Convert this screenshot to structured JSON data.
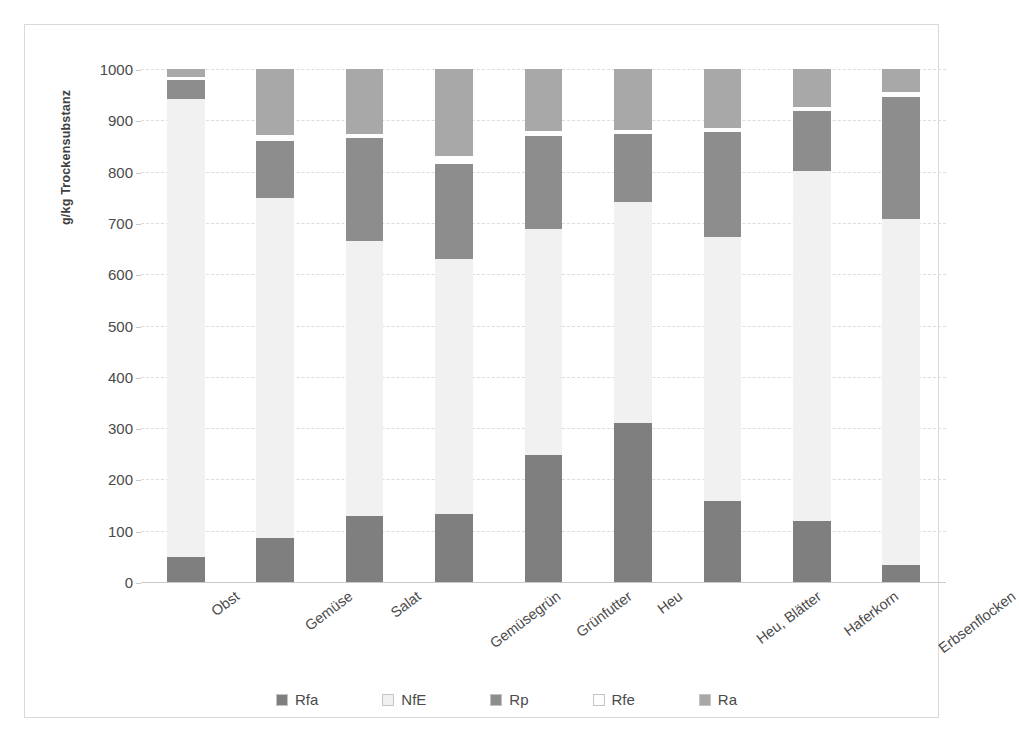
{
  "chart_data": {
    "type": "bar",
    "subtype": "stacked-bar",
    "title": "",
    "xlabel": "",
    "ylabel": "g/kg Trockensubstanz",
    "ylim": [
      0,
      1000
    ],
    "yticks": [
      0,
      100,
      200,
      300,
      400,
      500,
      600,
      700,
      800,
      900,
      1000
    ],
    "ytick_labels": [
      "0",
      "100",
      "200",
      "300",
      "400",
      "500",
      "600",
      "700",
      "800",
      "900",
      "1000"
    ],
    "grid": true,
    "legend_position": "bottom",
    "stack_order_bottom_to_top": [
      "Rfa",
      "NfE",
      "Rp",
      "Rfe",
      "Ra"
    ],
    "categories": [
      "Obst",
      "Gemüse",
      "Salat",
      "Gemüsegrün",
      "Grünfutter",
      "Heu",
      "Heu, Blätter",
      "Haferkorn",
      "Erbsenflocken"
    ],
    "series": [
      {
        "name": "Rfa",
        "color": "#7f7f7f",
        "values": [
          48,
          85,
          128,
          132,
          248,
          310,
          157,
          118,
          33
        ]
      },
      {
        "name": "NfE",
        "color": "#f1f1f1",
        "values": [
          893,
          663,
          537,
          498,
          440,
          430,
          515,
          683,
          675
        ]
      },
      {
        "name": "Rfe",
        "color": "#fdfdfd",
        "values": [
          7,
          12,
          9,
          16,
          11,
          8,
          8,
          8,
          9
        ],
        "note": "thin white band above NfE"
      },
      {
        "name": "Rp",
        "color": "#8d8d8d",
        "values": [
          37,
          112,
          200,
          185,
          181,
          133,
          205,
          117,
          238
        ]
      },
      {
        "name": "Ra",
        "color": "#a8a8a8",
        "values": [
          15,
          128,
          126,
          169,
          120,
          119,
          115,
          74,
          45
        ]
      }
    ],
    "bars": [
      {
        "category": "Obst",
        "segments": [
          {
            "name": "Rfa",
            "value": 48,
            "from": 0,
            "to": 48
          },
          {
            "name": "NfE",
            "value": 893,
            "from": 48,
            "to": 941
          },
          {
            "name": "Rp",
            "value": 37,
            "from": 941,
            "to": 978
          },
          {
            "name": "Rfe",
            "value": 7,
            "from": 978,
            "to": 985
          },
          {
            "name": "Ra",
            "value": 15,
            "from": 985,
            "to": 1000
          }
        ],
        "total": 1000
      },
      {
        "category": "Gemüse",
        "segments": [
          {
            "name": "Rfa",
            "value": 85,
            "from": 0,
            "to": 85
          },
          {
            "name": "NfE",
            "value": 663,
            "from": 85,
            "to": 748
          },
          {
            "name": "Rp",
            "value": 112,
            "from": 748,
            "to": 860
          },
          {
            "name": "Rfe",
            "value": 12,
            "from": 860,
            "to": 872
          },
          {
            "name": "Ra",
            "value": 128,
            "from": 872,
            "to": 1000
          }
        ],
        "total": 1000
      },
      {
        "category": "Salat",
        "segments": [
          {
            "name": "Rfa",
            "value": 128,
            "from": 0,
            "to": 128
          },
          {
            "name": "NfE",
            "value": 537,
            "from": 128,
            "to": 665
          },
          {
            "name": "Rp",
            "value": 200,
            "from": 665,
            "to": 865
          },
          {
            "name": "Rfe",
            "value": 9,
            "from": 865,
            "to": 874
          },
          {
            "name": "Ra",
            "value": 126,
            "from": 874,
            "to": 1000
          }
        ],
        "total": 1000
      },
      {
        "category": "Gemüsegrün",
        "segments": [
          {
            "name": "Rfa",
            "value": 132,
            "from": 0,
            "to": 132
          },
          {
            "name": "NfE",
            "value": 498,
            "from": 132,
            "to": 630
          },
          {
            "name": "Rp",
            "value": 185,
            "from": 630,
            "to": 815
          },
          {
            "name": "Rfe",
            "value": 16,
            "from": 815,
            "to": 831
          },
          {
            "name": "Ra",
            "value": 169,
            "from": 831,
            "to": 1000
          }
        ],
        "total": 1000
      },
      {
        "category": "Grünfutter",
        "segments": [
          {
            "name": "Rfa",
            "value": 248,
            "from": 0,
            "to": 248
          },
          {
            "name": "NfE",
            "value": 440,
            "from": 248,
            "to": 688
          },
          {
            "name": "Rp",
            "value": 181,
            "from": 688,
            "to": 869
          },
          {
            "name": "Rfe",
            "value": 11,
            "from": 869,
            "to": 880
          },
          {
            "name": "Ra",
            "value": 120,
            "from": 880,
            "to": 1000
          }
        ],
        "total": 1000
      },
      {
        "category": "Heu",
        "segments": [
          {
            "name": "Rfa",
            "value": 310,
            "from": 0,
            "to": 310
          },
          {
            "name": "NfE",
            "value": 430,
            "from": 310,
            "to": 740
          },
          {
            "name": "Rp",
            "value": 133,
            "from": 740,
            "to": 873
          },
          {
            "name": "Rfe",
            "value": 8,
            "from": 873,
            "to": 881
          },
          {
            "name": "Ra",
            "value": 119,
            "from": 881,
            "to": 1000
          }
        ],
        "total": 1000
      },
      {
        "category": "Heu, Blätter",
        "segments": [
          {
            "name": "Rfa",
            "value": 157,
            "from": 0,
            "to": 157
          },
          {
            "name": "NfE",
            "value": 515,
            "from": 157,
            "to": 672
          },
          {
            "name": "Rp",
            "value": 205,
            "from": 672,
            "to": 877
          },
          {
            "name": "Rfe",
            "value": 8,
            "from": 877,
            "to": 885
          },
          {
            "name": "Ra",
            "value": 115,
            "from": 885,
            "to": 1000
          }
        ],
        "total": 1000
      },
      {
        "category": "Haferkorn",
        "segments": [
          {
            "name": "Rfa",
            "value": 118,
            "from": 0,
            "to": 118
          },
          {
            "name": "NfE",
            "value": 683,
            "from": 118,
            "to": 801
          },
          {
            "name": "Rp",
            "value": 117,
            "from": 801,
            "to": 918
          },
          {
            "name": "Rfe",
            "value": 8,
            "from": 918,
            "to": 926
          },
          {
            "name": "Ra",
            "value": 74,
            "from": 926,
            "to": 1000
          }
        ],
        "total": 1000
      },
      {
        "category": "Erbsenflocken",
        "segments": [
          {
            "name": "Rfa",
            "value": 33,
            "from": 0,
            "to": 33
          },
          {
            "name": "NfE",
            "value": 675,
            "from": 33,
            "to": 708
          },
          {
            "name": "Rp",
            "value": 238,
            "from": 708,
            "to": 946
          },
          {
            "name": "Rfe",
            "value": 9,
            "from": 946,
            "to": 955
          },
          {
            "name": "Ra",
            "value": 45,
            "from": 955,
            "to": 1000
          }
        ],
        "total": 1000
      }
    ],
    "legend": [
      {
        "label": "Rfa",
        "color": "#7f7f7f"
      },
      {
        "label": "NfE",
        "color": "#f1f1f1"
      },
      {
        "label": "Rp",
        "color": "#8d8d8d"
      },
      {
        "label": "Rfe",
        "color": "#fdfdfd"
      },
      {
        "label": "Ra",
        "color": "#a8a8a8"
      }
    ]
  }
}
